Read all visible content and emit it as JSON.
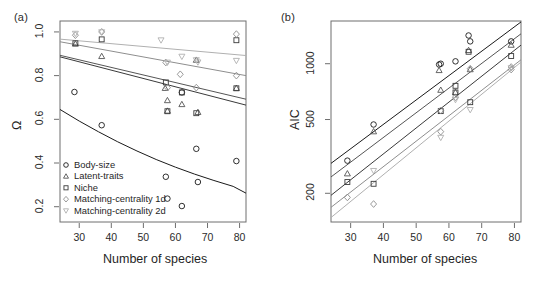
{
  "figure": {
    "panels": [
      {
        "tag": "(a)",
        "xlabel": "Number of species",
        "ylabel": "Ω"
      },
      {
        "tag": "(b)",
        "xlabel": "Number of species",
        "ylabel": "AIC"
      }
    ]
  },
  "legend": {
    "entries": [
      {
        "label": "Body-size",
        "symbol": "circle",
        "color": "#1a1a1a"
      },
      {
        "label": "Latent-traits",
        "symbol": "triangle-up",
        "color": "#555555"
      },
      {
        "label": "Niche",
        "symbol": "square",
        "color": "#3a3a3a"
      },
      {
        "label": "Matching-centrality 1d",
        "symbol": "diamond",
        "color": "#8e8e8e"
      },
      {
        "label": "Matching-centrality 2d",
        "symbol": "triangle-down",
        "color": "#b0b0b0"
      }
    ]
  },
  "chart_data": [
    {
      "type": "scatter",
      "panel": "(a)",
      "title": "",
      "xlabel": "Number of species",
      "ylabel": "Ω",
      "xlim": [
        24,
        82
      ],
      "ylim": [
        0.13,
        1.05
      ],
      "xticks": [
        30,
        40,
        50,
        60,
        70,
        80
      ],
      "yticks": [
        0.2,
        0.4,
        0.6,
        0.8,
        1.0
      ],
      "ytick_labels": [
        "0.2",
        "0.4",
        "0.6",
        "0.8",
        "1.0"
      ],
      "yscale": "linear",
      "grid": false,
      "legend_position": "bottom-left",
      "series": [
        {
          "name": "Body-size",
          "symbol": "circle",
          "color": "#1a1a1a",
          "x": [
            28.5,
            37,
            57,
            57.5,
            62,
            62,
            66.5,
            67,
            79
          ],
          "y": [
            0.725,
            0.573,
            0.337,
            0.237,
            0.723,
            0.203,
            0.465,
            0.313,
            0.409
          ],
          "fit": {
            "type": "curve",
            "points": [
              [
                24,
                0.645
              ],
              [
                30,
                0.592
              ],
              [
                36,
                0.543
              ],
              [
                42,
                0.497
              ],
              [
                48,
                0.455
              ],
              [
                54,
                0.416
              ],
              [
                60,
                0.381
              ],
              [
                66,
                0.349
              ],
              [
                72,
                0.32
              ],
              [
                78,
                0.293
              ],
              [
                82,
                0.262
              ]
            ]
          }
        },
        {
          "name": "Latent-traits",
          "symbol": "triangle-up",
          "color": "#555555",
          "x": [
            28.8,
            37,
            56.8,
            57.5,
            57.5,
            62,
            66.5,
            67,
            79
          ],
          "y": [
            0.945,
            0.888,
            0.742,
            0.686,
            0.638,
            0.668,
            0.871,
            0.632,
            0.742
          ],
          "fit": {
            "type": "line",
            "points": [
              [
                24,
                0.893
              ],
              [
                82,
                0.692
              ]
            ]
          }
        },
        {
          "name": "Niche",
          "symbol": "square",
          "color": "#3a3a3a",
          "x": [
            28.8,
            37,
            57,
            57.5,
            62,
            66.5,
            79,
            79
          ],
          "y": [
            0.948,
            0.966,
            0.769,
            0.637,
            0.723,
            0.628,
            0.962,
            0.742
          ],
          "fit": {
            "type": "line",
            "points": [
              [
                24,
                0.886
              ],
              [
                82,
                0.665
              ]
            ]
          }
        },
        {
          "name": "Matching-centrality 1d",
          "symbol": "diamond",
          "color": "#8e8e8e",
          "x": [
            28.8,
            37,
            57,
            57.5,
            61.5,
            66.5,
            79,
            79
          ],
          "y": [
            0.985,
            1.0,
            0.86,
            0.745,
            0.806,
            0.745,
            0.99,
            0.8
          ],
          "fit": {
            "type": "line",
            "points": [
              [
                24,
                0.955
              ],
              [
                82,
                0.8
              ]
            ]
          }
        },
        {
          "name": "Matching-centrality 2d",
          "symbol": "triangle-down",
          "color": "#b0b0b0",
          "x": [
            28.8,
            37,
            55.5,
            57.5,
            62,
            66.5,
            67,
            79
          ],
          "y": [
            0.993,
            1.0,
            0.963,
            0.861,
            0.888,
            0.872,
            0.862,
            0.869
          ],
          "fit": {
            "type": "line",
            "points": [
              [
                24,
                0.967
              ],
              [
                82,
                0.892
              ]
            ]
          }
        }
      ]
    },
    {
      "type": "scatter",
      "panel": "(b)",
      "title": "",
      "xlabel": "Number of species",
      "ylabel": "AIC",
      "xlim": [
        24,
        82
      ],
      "ylim": [
        140,
        1700
      ],
      "xticks": [
        30,
        40,
        50,
        60,
        70,
        80
      ],
      "yticks": [
        200,
        500,
        1000
      ],
      "ytick_labels": [
        "200",
        "500",
        "1000"
      ],
      "yscale": "log",
      "grid": false,
      "legend_position": "none",
      "series": [
        {
          "name": "Body-size",
          "symbol": "circle",
          "color": "#1a1a1a",
          "x": [
            29,
            37,
            57,
            57.5,
            62,
            66,
            66.5,
            79
          ],
          "y": [
            300,
            470,
            990,
            1000,
            1030,
            1420,
            1320,
            1320
          ],
          "fit": {
            "type": "line",
            "points": [
              [
                24,
                290
              ],
              [
                82,
                1680
              ]
            ]
          }
        },
        {
          "name": "Latent-traits",
          "symbol": "triangle-up",
          "color": "#555555",
          "x": [
            29,
            37,
            57,
            57.5,
            62,
            66,
            66.5,
            79
          ],
          "y": [
            255,
            430,
            920,
            720,
            700,
            1180,
            930,
            1260
          ],
          "fit": {
            "type": "line",
            "points": [
              [
                24,
                245
              ],
              [
                82,
                1450
              ]
            ]
          }
        },
        {
          "name": "Niche",
          "symbol": "square",
          "color": "#3a3a3a",
          "x": [
            29,
            37,
            57.5,
            62,
            62,
            66,
            66.5,
            79
          ],
          "y": [
            230,
            225,
            555,
            760,
            700,
            1160,
            620,
            1100
          ],
          "fit": {
            "type": "line",
            "points": [
              [
                24,
                195
              ],
              [
                82,
                1260
              ]
            ]
          }
        },
        {
          "name": "Matching-centrality 1d",
          "symbol": "diamond",
          "color": "#8e8e8e",
          "x": [
            29,
            37,
            57.5,
            57.5,
            62,
            66.5,
            79,
            79
          ],
          "y": [
            190,
            175,
            430,
            560,
            660,
            940,
            960,
            930
          ],
          "fit": {
            "type": "line",
            "points": [
              [
                24,
                168
              ],
              [
                82,
                1050
              ]
            ]
          }
        },
        {
          "name": "Matching-centrality 2d",
          "symbol": "triangle-down",
          "color": "#b0b0b0",
          "x": [
            37,
            57.5,
            62,
            66.5,
            79
          ],
          "y": [
            265,
            400,
            640,
            565,
            950
          ],
          "fit": {
            "type": "line",
            "points": [
              [
                24,
                148
              ],
              [
                82,
                1020
              ]
            ]
          }
        }
      ]
    }
  ]
}
